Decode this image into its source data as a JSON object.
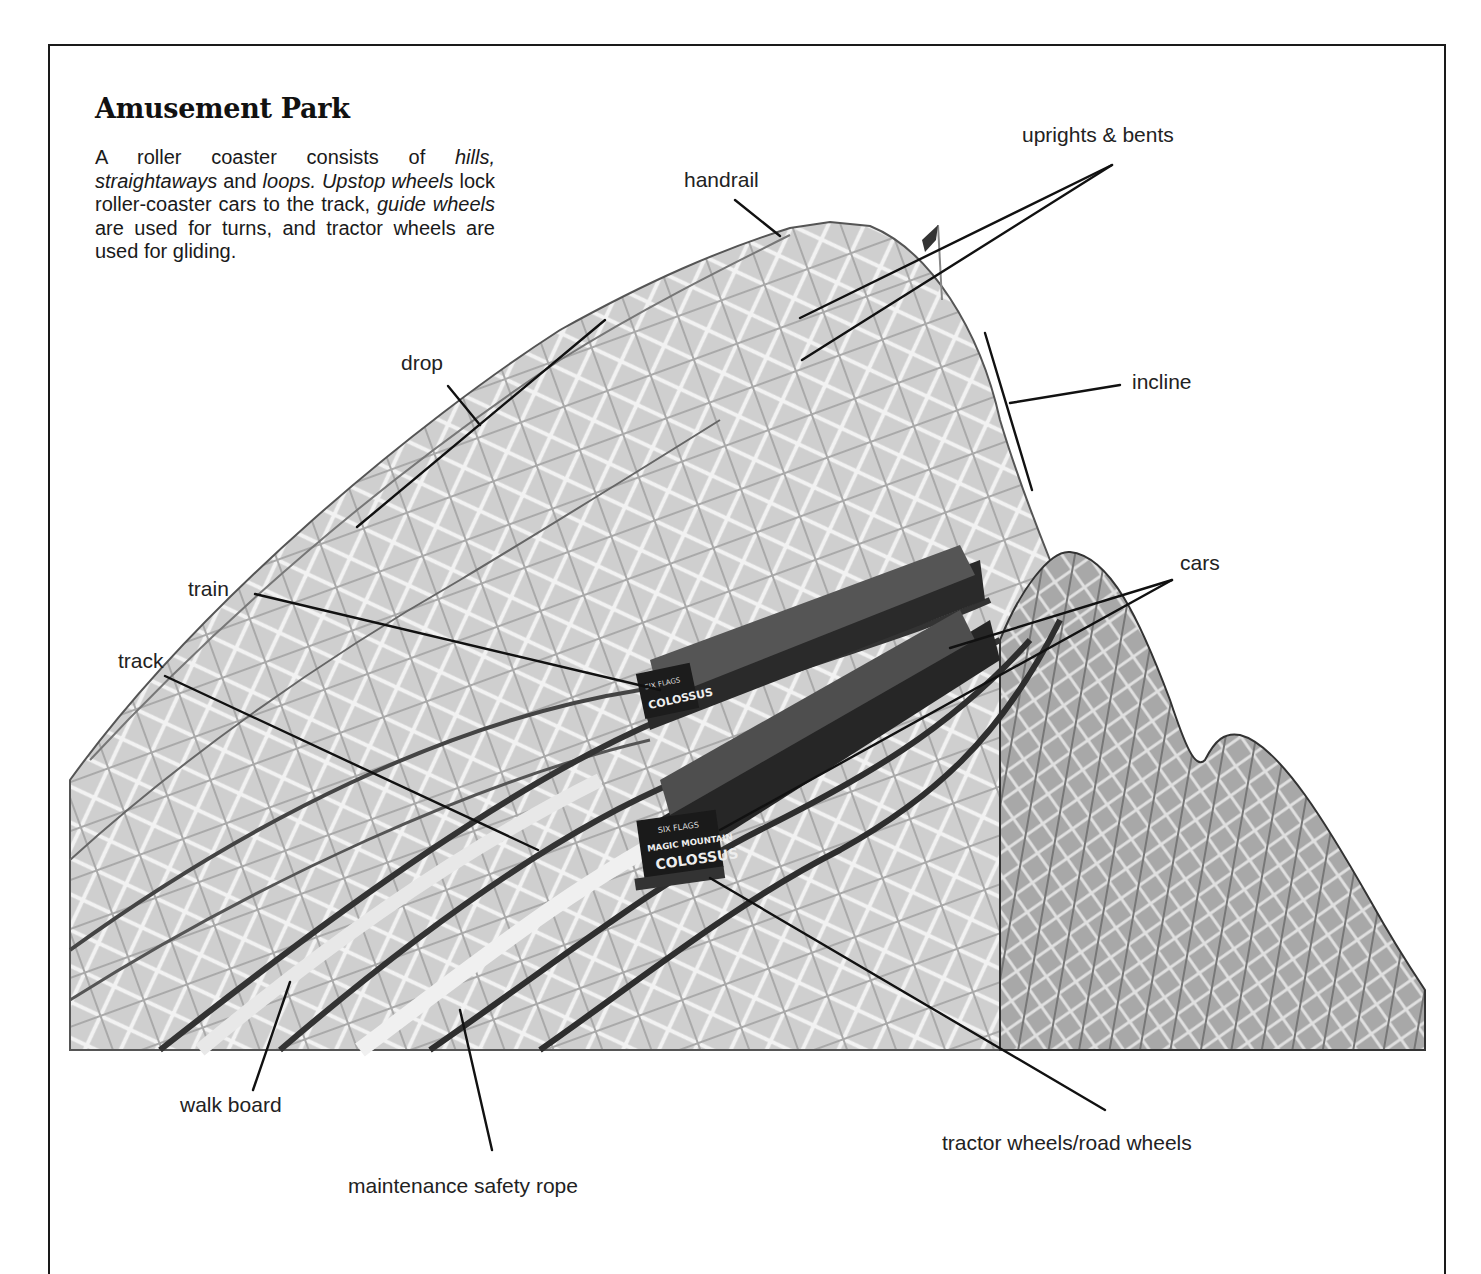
{
  "page": {
    "title": "Amusement Park",
    "intro": {
      "segments": [
        {
          "text": "A roller coaster consists of ",
          "italic": false
        },
        {
          "text": "hills,",
          "italic": true
        },
        {
          "text": " ",
          "italic": false
        },
        {
          "text": "straightaways",
          "italic": true
        },
        {
          "text": " and ",
          "italic": false
        },
        {
          "text": "loops.",
          "italic": true
        },
        {
          "text": " ",
          "italic": false
        },
        {
          "text": "Upstop wheels",
          "italic": true
        },
        {
          "text": " lock roller-coaster cars to the track, ",
          "italic": false
        },
        {
          "text": "guide wheels",
          "italic": true
        },
        {
          "text": " are used for turns, and tractor wheels are used for gliding.",
          "italic": false
        }
      ]
    }
  },
  "photo": {
    "subject": "wooden roller coaster with two trains descending",
    "sign_text": [
      "SIX FLAGS",
      "MAGIC MOUNTAIN",
      "COLOSSUS"
    ],
    "colors": {
      "structure": "#bdbdbd",
      "structure_dark": "#7a7a7a",
      "car": "#222222",
      "line": "#111111"
    }
  },
  "labels": {
    "uprights_bents": "uprights & bents",
    "handrail": "handrail",
    "drop": "drop",
    "incline": "incline",
    "train": "train",
    "cars": "cars",
    "track": "track",
    "walk_board": "walk board",
    "maintenance_safety_rope": "maintenance safety rope",
    "tractor_wheels": "tractor wheels/road wheels"
  }
}
